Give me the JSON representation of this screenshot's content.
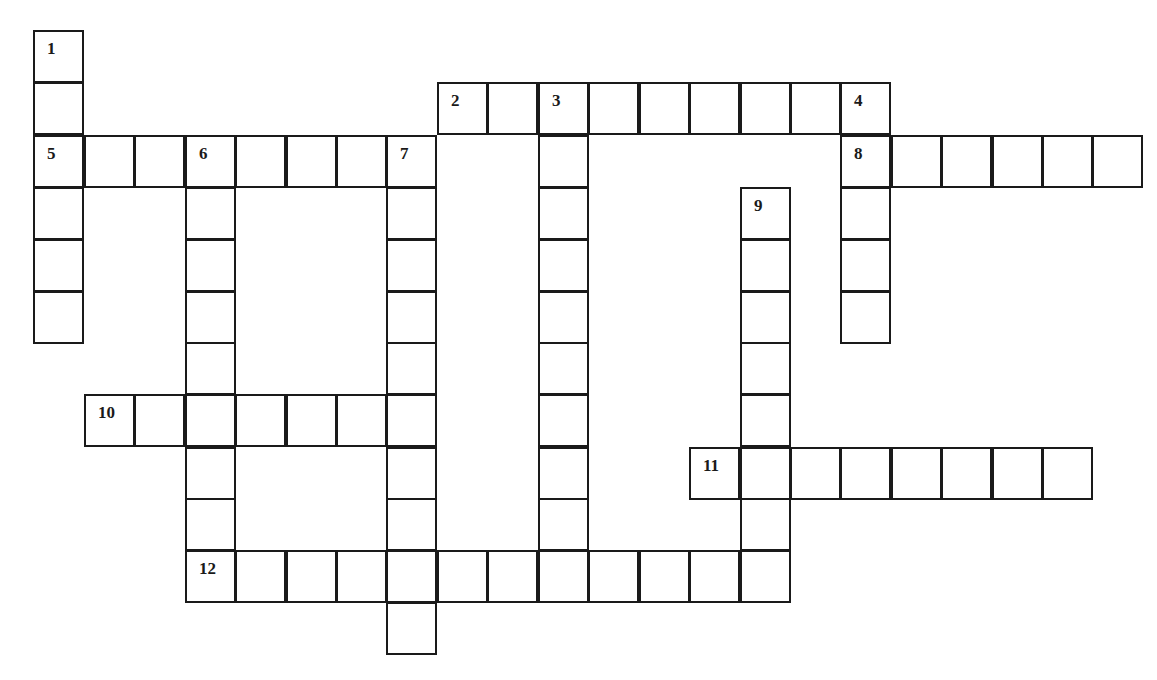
{
  "puzzle": {
    "title": "Crossword grid",
    "line_color": "#1a1a1a",
    "background": "#ffffff",
    "col_x": [
      33,
      84,
      134,
      185,
      235,
      286,
      336,
      386,
      437,
      487,
      538,
      588,
      639,
      689,
      740,
      790,
      840,
      891,
      941,
      992,
      1042,
      1092
    ],
    "row_y": [
      30,
      82,
      135,
      187,
      239,
      291,
      342,
      394,
      447,
      498,
      550,
      602
    ],
    "cell_w": 51,
    "cell_h": 53,
    "words": [
      {
        "number": "1",
        "direction": "down",
        "row": 0,
        "col": 0,
        "length": 6
      },
      {
        "number": "2",
        "direction": "across",
        "row": 1,
        "col": 8,
        "length": 9
      },
      {
        "number": "3",
        "direction": "down",
        "row": 1,
        "col": 10,
        "length": 9
      },
      {
        "number": "4",
        "direction": "down",
        "row": 1,
        "col": 16,
        "length": 5
      },
      {
        "number": "5",
        "direction": "across",
        "row": 2,
        "col": 0,
        "length": 8
      },
      {
        "number": "6",
        "direction": "down",
        "row": 2,
        "col": 3,
        "length": 9
      },
      {
        "number": "7",
        "direction": "down",
        "row": 2,
        "col": 7,
        "length": 10
      },
      {
        "number": "8",
        "direction": "across",
        "row": 2,
        "col": 16,
        "length": 6
      },
      {
        "number": "9",
        "direction": "down",
        "row": 3,
        "col": 14,
        "length": 8
      },
      {
        "number": "10",
        "direction": "across",
        "row": 7,
        "col": 1,
        "length": 7
      },
      {
        "number": "11",
        "direction": "across",
        "row": 8,
        "col": 13,
        "length": 8
      },
      {
        "number": "12",
        "direction": "across",
        "row": 10,
        "col": 3,
        "length": 12
      }
    ]
  }
}
